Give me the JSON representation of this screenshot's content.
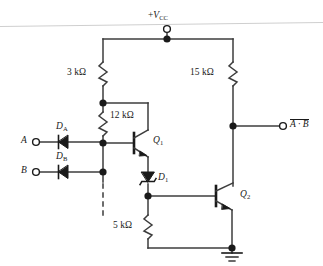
{
  "diagram": {
    "type": "schematic",
    "colors": {
      "wire": "#3d3d3d",
      "node": "#1a1a1a",
      "text": "#1a1a1a",
      "background": "#ffffff",
      "artifact": "#c9c9c9"
    }
  },
  "supply": {
    "label_sign": "+",
    "label_name": "V",
    "label_sub": "CC",
    "terminal": "open-circle"
  },
  "resistors": [
    {
      "id": "r3k",
      "value": "3 kΩ"
    },
    {
      "id": "r12k",
      "value": "12 kΩ"
    },
    {
      "id": "r15k",
      "value": "15 kΩ"
    },
    {
      "id": "r5k",
      "value": "5 kΩ"
    }
  ],
  "diodes": [
    {
      "id": "da",
      "name": "D",
      "sub": "A",
      "kind": "signal"
    },
    {
      "id": "db",
      "name": "D",
      "sub": "B",
      "kind": "signal"
    },
    {
      "id": "d1",
      "name": "D",
      "sub": "1",
      "kind": "zener"
    }
  ],
  "transistors": [
    {
      "id": "q1",
      "name": "Q",
      "sub": "1",
      "kind": "npn"
    },
    {
      "id": "q2",
      "name": "Q",
      "sub": "2",
      "kind": "npn"
    }
  ],
  "inputs": [
    {
      "id": "a",
      "label": "A",
      "terminal": "open-circle"
    },
    {
      "id": "b",
      "label": "B",
      "terminal": "open-circle"
    }
  ],
  "output": {
    "id": "out",
    "expr": "A · B",
    "overbar": true,
    "terminal": "open-circle"
  },
  "ground": {
    "label": "",
    "symbol": "earth-ground"
  },
  "extension": {
    "style": "dashed",
    "meaning": "additional inputs"
  }
}
